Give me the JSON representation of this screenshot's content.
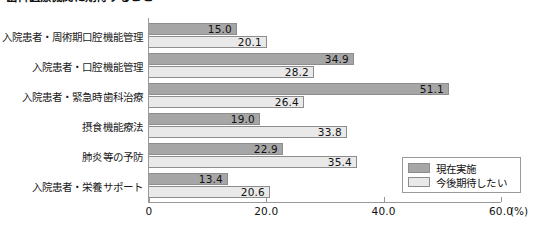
{
  "chart_data": {
    "type": "bar",
    "orientation": "horizontal",
    "title": "歯科医療機関に期待すること",
    "xlabel": "(%)",
    "ylabel": "",
    "xlim": [
      0,
      60
    ],
    "xticks": [
      0,
      20,
      40,
      60
    ],
    "xtick_labels": [
      "0",
      "20.0",
      "40.0",
      "60.0"
    ],
    "grid": false,
    "legend_position": "bottom-right",
    "categories": [
      "入院患者・周術期口腔機能管理",
      "入院患者・口腔機能管理",
      "入院患者・緊急時歯科治療",
      "摂食機能療法",
      "肺炎等の予防",
      "入院患者・栄養サポート"
    ],
    "series": [
      {
        "name": "現在実施",
        "color": "#a6a6a6",
        "values": [
          15.0,
          34.9,
          51.1,
          19.0,
          22.9,
          13.4
        ],
        "value_labels": [
          "15.0",
          "34.9",
          "51.1",
          "19.0",
          "22.9",
          "13.4"
        ]
      },
      {
        "name": "今後期待したい",
        "color": "#e9e9e9",
        "values": [
          20.1,
          28.2,
          26.4,
          33.8,
          35.4,
          20.6
        ],
        "value_labels": [
          "20.1",
          "28.2",
          "26.4",
          "33.8",
          "35.4",
          "20.6"
        ]
      }
    ]
  },
  "legend": {
    "items": [
      {
        "label": "現在実施",
        "color": "#a6a6a6"
      },
      {
        "label": "今後期待したい",
        "color": "#e9e9e9"
      }
    ]
  },
  "axis_unit": "(%)"
}
